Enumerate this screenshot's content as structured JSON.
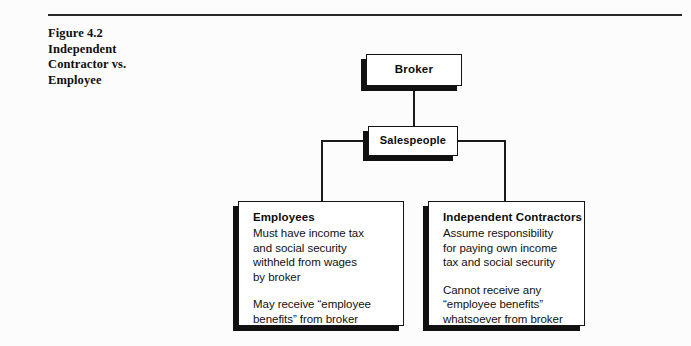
{
  "page": {
    "background_color": "#fcfcfc",
    "rule_color": "#2a2a2a"
  },
  "caption": {
    "line1": "Figure 4.2",
    "line2": "Independent",
    "line3": "Contractor vs.",
    "line4": "Employee"
  },
  "diagram": {
    "type": "org-chart",
    "nodes": {
      "broker": {
        "title": "Broker"
      },
      "salespeople": {
        "title": "Salespeople"
      },
      "employees": {
        "title": "Employees",
        "paragraph1": [
          "Must have income tax",
          "and social security",
          "withheld from wages",
          "by broker"
        ],
        "paragraph2": [
          "May receive “employee",
          "benefits” from broker"
        ]
      },
      "contractors": {
        "title": "Independent Contractors",
        "paragraph1": [
          "Assume responsibility",
          "for paying own income",
          "tax and social security"
        ],
        "paragraph2": [
          "Cannot receive any",
          "“employee benefits”",
          "whatsoever from broker"
        ]
      }
    },
    "edges": [
      {
        "from": "broker",
        "to": "salespeople"
      },
      {
        "from": "salespeople",
        "to": "employees"
      },
      {
        "from": "salespeople",
        "to": "contractors"
      }
    ]
  }
}
